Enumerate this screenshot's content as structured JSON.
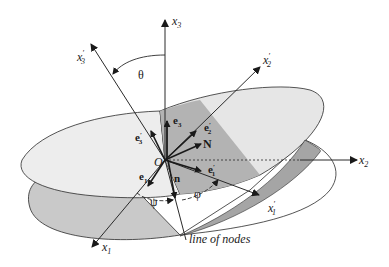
{
  "diagram": {
    "type": "euler-angles-rotation",
    "origin_label": "O",
    "axes_fixed": [
      {
        "name": "x1",
        "base": "x",
        "sub": "1",
        "prime": false
      },
      {
        "name": "x2",
        "base": "x",
        "sub": "2",
        "prime": false
      },
      {
        "name": "x3",
        "base": "x",
        "sub": "3",
        "prime": false
      }
    ],
    "axes_body": [
      {
        "name": "x1'",
        "base": "x",
        "sub": "1",
        "prime": true
      },
      {
        "name": "x2'",
        "base": "x",
        "sub": "2",
        "prime": true
      },
      {
        "name": "x3'",
        "base": "x",
        "sub": "3",
        "prime": true
      }
    ],
    "unit_vectors": {
      "e1": {
        "base": "e",
        "sub": "1"
      },
      "e3": {
        "base": "e",
        "sub": "3"
      },
      "e1p": {
        "base": "e",
        "sub": "1",
        "prime": "′"
      },
      "e2p": {
        "base": "e",
        "sub": "2",
        "prime": "′"
      },
      "e3p": {
        "base": "e",
        "sub": "3",
        "prime": "′"
      },
      "N": "N",
      "n": "n"
    },
    "angles": {
      "theta": "θ",
      "psi": "ψ",
      "phi": "φ"
    },
    "line_of_nodes_label": "line of nodes",
    "colors": {
      "line": "#2a2a2a",
      "upper_plane": "#ececec",
      "lower_plane_shaded": "#c8c8c8",
      "wedge_dark": "#a8a8a8",
      "background": "#ffffff"
    }
  }
}
